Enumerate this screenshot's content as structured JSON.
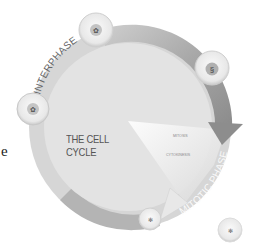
{
  "diagram": {
    "title": "THE CELL CYCLE",
    "title_lines": [
      "THE CELL",
      "CYCLE"
    ],
    "phases": {
      "interphase": "INTERPHASE",
      "mitotic_phase": "MITOTIC PHASE"
    },
    "mitotic_subphases": [
      "MITOSIS",
      "CYTOKINESIS"
    ],
    "cells": [
      {
        "name": "cell-top",
        "position": "top"
      },
      {
        "name": "cell-upper-right",
        "position": "upper-right"
      },
      {
        "name": "cell-left",
        "position": "left"
      },
      {
        "name": "cell-bottom",
        "position": "bottom"
      },
      {
        "name": "daughter-cell",
        "position": "bottom-right"
      }
    ],
    "colors": {
      "disc": "#e4e4e4",
      "ring_light": "#d2d2d2",
      "ring_dark": "#8f8f8f",
      "arrow": "#9a9a9a",
      "cell_fill": "#f2f2f2",
      "nucleus": "#b8b8b8",
      "text": "#555555"
    }
  },
  "page": {
    "stray_text": "e"
  }
}
